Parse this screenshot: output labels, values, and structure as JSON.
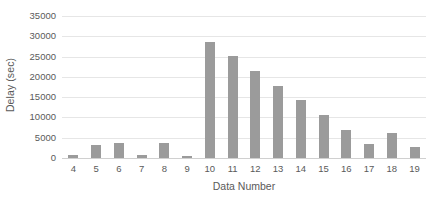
{
  "chart_data": {
    "type": "bar",
    "title": "",
    "subtitle": "",
    "xlabel": "Data Number",
    "ylabel": "Delay (sec)",
    "categories": [
      "4",
      "5",
      "6",
      "7",
      "8",
      "9",
      "10",
      "11",
      "12",
      "13",
      "14",
      "15",
      "16",
      "17",
      "18",
      "19"
    ],
    "values": [
      700,
      3100,
      3700,
      700,
      3800,
      600,
      28700,
      25200,
      21400,
      17800,
      14400,
      10500,
      7000,
      3500,
      6200,
      2600
    ],
    "series": [
      {
        "name": "Delay",
        "values": [
          700,
          3100,
          3700,
          700,
          3800,
          600,
          28700,
          25200,
          21400,
          17800,
          14400,
          10500,
          7000,
          3500,
          6200,
          2600
        ]
      }
    ],
    "ylim": [
      0,
      35000
    ],
    "ytick_values": [
      0,
      5000,
      10000,
      15000,
      20000,
      25000,
      30000,
      35000
    ],
    "ytick_labels": [
      "0",
      "5000",
      "10000",
      "15000",
      "20000",
      "25000",
      "30000",
      "35000"
    ],
    "xtick_labels": [
      "4",
      "5",
      "6",
      "7",
      "8",
      "9",
      "10",
      "11",
      "12",
      "13",
      "14",
      "15",
      "16",
      "17",
      "18",
      "19"
    ],
    "grid": true,
    "grid_axis": "y",
    "legend": false,
    "legend_position": "none",
    "bar_color": "#9b9b9b",
    "gridline_color": "#e6e6e6",
    "axis_text_color": "#5a5a5a",
    "background_color": "#ffffff",
    "annotations": []
  }
}
